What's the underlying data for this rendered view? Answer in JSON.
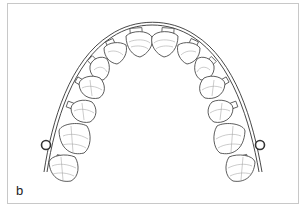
{
  "figure": {
    "panel_label": "b",
    "colors": {
      "outline": "#333333",
      "detail": "#999999",
      "frame": "#c8c8c8",
      "background": "#ffffff"
    },
    "teeth_per_side": [
      "central incisor",
      "lateral incisor",
      "canine",
      "first premolar",
      "second premolar",
      "first molar",
      "second molar"
    ]
  }
}
